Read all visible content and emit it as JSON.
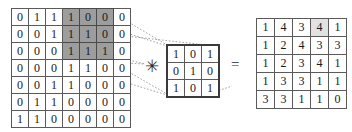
{
  "diagram": {
    "operators": {
      "convolution_symbol": "✳",
      "equals_symbol": "="
    },
    "colors": {
      "highlight_input": "#9d9d9d",
      "highlight_output": "#e2e2e2",
      "grid_line": "#5a5a5a",
      "kernel_border": "#3a3a3a",
      "text": "#1a1a1a",
      "background": "#ffffff"
    }
  },
  "input_matrix": {
    "name": "input-image",
    "rows": 7,
    "cols": 7,
    "values": [
      [
        0,
        1,
        1,
        1,
        0,
        0,
        0
      ],
      [
        0,
        0,
        1,
        1,
        1,
        0,
        0
      ],
      [
        0,
        0,
        0,
        1,
        1,
        1,
        0
      ],
      [
        0,
        0,
        0,
        1,
        1,
        0,
        0
      ],
      [
        0,
        0,
        1,
        1,
        0,
        0,
        0
      ],
      [
        0,
        1,
        1,
        0,
        0,
        0,
        0
      ],
      [
        1,
        1,
        0,
        0,
        0,
        0,
        0
      ]
    ],
    "highlight_cells": [
      [
        0,
        3
      ],
      [
        0,
        4
      ],
      [
        0,
        5
      ],
      [
        1,
        3
      ],
      [
        1,
        4
      ],
      [
        1,
        5
      ],
      [
        2,
        3
      ],
      [
        2,
        4
      ],
      [
        2,
        5
      ]
    ]
  },
  "kernel_matrix": {
    "name": "convolution-kernel",
    "rows": 3,
    "cols": 3,
    "values": [
      [
        1,
        0,
        1
      ],
      [
        0,
        1,
        0
      ],
      [
        1,
        0,
        1
      ]
    ]
  },
  "output_matrix": {
    "name": "convolved-feature",
    "rows": 5,
    "cols": 5,
    "values": [
      [
        1,
        4,
        3,
        4,
        1
      ],
      [
        1,
        2,
        4,
        3,
        3
      ],
      [
        1,
        2,
        3,
        4,
        1
      ],
      [
        1,
        3,
        3,
        1,
        1
      ],
      [
        3,
        3,
        1,
        1,
        0
      ]
    ],
    "highlight_cells": [
      [
        0,
        3
      ]
    ]
  },
  "projection_lines": [
    {
      "from": "input-highlight-top-right",
      "to": "kernel-top-right"
    },
    {
      "from": "input-highlight-top-right-lower",
      "to": "kernel-top-left"
    },
    {
      "from": "input-highlight-bottom-right",
      "to": "kernel-bottom-right"
    },
    {
      "from": "input-highlight-bottom-left",
      "to": "kernel-bottom-left"
    }
  ]
}
